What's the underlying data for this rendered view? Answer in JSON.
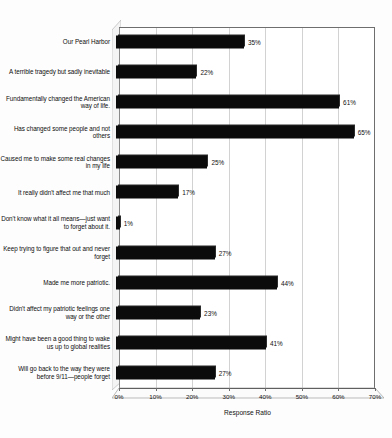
{
  "chart_data": {
    "type": "bar",
    "orientation": "horizontal",
    "title": "",
    "xlabel": "Response Ratio",
    "ylabel": "",
    "xlim": [
      0,
      70
    ],
    "xtick_labels": [
      "0%",
      "10%",
      "20%",
      "30%",
      "40%",
      "50%",
      "60%",
      "70%"
    ],
    "xticks": [
      0,
      10,
      20,
      30,
      40,
      50,
      60,
      70
    ],
    "grid": true,
    "legend": false,
    "value_suffix": "%",
    "bar_color": "#0b0b0b",
    "categories": [
      "Our Pearl Harbor",
      "A terrible tragedy but sadly inevitable",
      "Fundamentally changed the American way of life.",
      "Has changed some people and not others",
      "Caused me to make some real changes in my life",
      "It really didn't affect me that much",
      "Don't know what it all means—just want to forget about it.",
      "Keep trying to figure that out and never forget",
      "Made me more patriotic.",
      "Didn't affect my patriotic feelings one way or the other",
      "Might have been a good thing to wake us up to global realities",
      "Will go back to the way they were before 9/11—people forget"
    ],
    "values": [
      35,
      22,
      61,
      65,
      25,
      17,
      1,
      27,
      44,
      23,
      41,
      27
    ],
    "value_labels": [
      "35%",
      "22%",
      "61%",
      "65%",
      "25%",
      "17%",
      "1%",
      "27%",
      "44%",
      "23%",
      "41%",
      "27%"
    ]
  }
}
